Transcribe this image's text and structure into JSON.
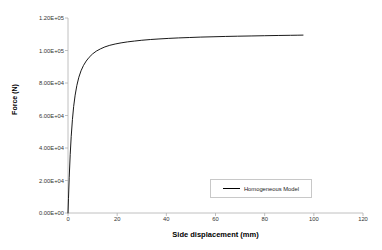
{
  "chart_data": {
    "type": "line",
    "title": "",
    "xlabel": "Side displacement (mm)",
    "ylabel": "Force (N)",
    "xlim": [
      0,
      120
    ],
    "ylim": [
      0,
      120000
    ],
    "xticks": [
      "0",
      "20",
      "40",
      "60",
      "80",
      "100",
      "120"
    ],
    "xtick_values": [
      0,
      20,
      40,
      60,
      80,
      100,
      120
    ],
    "yticks": [
      "0.00E+00",
      "2.00E+04",
      "4.00E+04",
      "6.00E+04",
      "8.00E+04",
      "1.00E+05",
      "1.20E+05"
    ],
    "ytick_values": [
      0,
      20000,
      40000,
      60000,
      80000,
      100000,
      120000
    ],
    "grid": false,
    "legend_position": "bottom-right",
    "series": [
      {
        "name": "Homogeneous Model",
        "color": "#000000",
        "x": [
          0,
          0.2,
          0.5,
          0.9,
          1.3,
          1.8,
          2.3,
          2.9,
          3.6,
          4.4,
          5.3,
          6.3,
          7.4,
          8.6,
          10.0,
          11.5,
          13.2,
          15.0,
          17.0,
          19.2,
          21.6,
          24.2,
          27.0,
          30.0,
          33.5,
          37.0,
          41.0,
          45.0,
          49.5,
          54.0,
          59.0,
          64.0,
          69.0,
          74.5,
          80.0,
          85.5,
          90.5,
          93.5,
          95.6
        ],
        "y": [
          0,
          9000,
          22000,
          36000,
          47000,
          57500,
          65500,
          72500,
          78500,
          83500,
          87500,
          90800,
          93500,
          95800,
          97900,
          99600,
          101000,
          102200,
          103200,
          104000,
          104700,
          105300,
          105800,
          106300,
          106750,
          107100,
          107450,
          107750,
          108000,
          108250,
          108450,
          108650,
          108800,
          108950,
          109100,
          109250,
          109350,
          109420,
          109470
        ]
      }
    ]
  },
  "legend": {
    "entries": [
      {
        "label": "Homogeneous Model",
        "color": "#000000"
      }
    ]
  }
}
